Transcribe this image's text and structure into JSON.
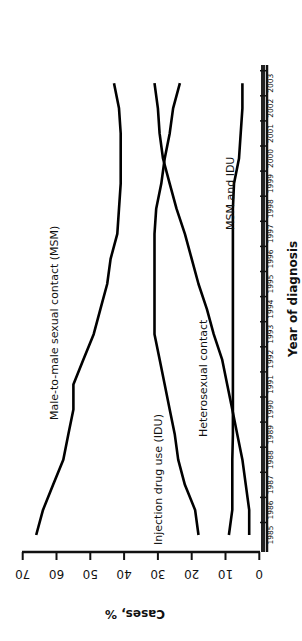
{
  "chart_data": {
    "type": "line",
    "title": "",
    "xlabel": "Year of diagnosis",
    "ylabel": "Cases, %",
    "ylim": [
      0,
      70
    ],
    "yticks": [
      0,
      10,
      20,
      30,
      40,
      50,
      60,
      70
    ],
    "grid": false,
    "legend_position": "inline labels",
    "orientation": "rotated 90° clockwise (x-axis on right, years ascending upward)",
    "x": [
      1985,
      1986,
      1987,
      1988,
      1989,
      1990,
      1991,
      1992,
      1993,
      1994,
      1995,
      1996,
      1997,
      1998,
      1999,
      2000,
      2001,
      2002,
      2003
    ],
    "series": [
      {
        "name": "Male-to-male sexual contact (MSM)",
        "values": [
          66,
          64,
          61,
          58,
          56.5,
          55,
          55,
          52,
          49,
          47,
          45,
          44,
          42,
          41.5,
          41,
          41,
          41,
          41.5,
          43
        ]
      },
      {
        "name": "Injection drug use (IDU)",
        "values": [
          18,
          19,
          22,
          24,
          25,
          26.5,
          28,
          29.5,
          31,
          31,
          31,
          31,
          31,
          30.5,
          29,
          28,
          26.5,
          25.5,
          23.5
        ]
      },
      {
        "name": "Heterosexual contact",
        "values": [
          3,
          3,
          4,
          5,
          6.5,
          8,
          9.5,
          11,
          13.5,
          15.5,
          18,
          20,
          22,
          24.5,
          26.5,
          28.5,
          29.5,
          30,
          31
        ]
      },
      {
        "name": "MSM and IDU",
        "values": [
          9,
          8,
          8,
          8,
          7.8,
          7.8,
          7.8,
          7.8,
          7.8,
          7.8,
          7.8,
          7.8,
          7.8,
          7.8,
          7.5,
          6,
          5.5,
          5,
          5
        ]
      }
    ]
  },
  "labels": {
    "msm": "Male-to-male sexual contact (MSM)",
    "idu": "Injection drug use (IDU)",
    "hetero": "Heterosexual contact",
    "msm_idu": "MSM and IDU",
    "xlabel": "Year of diagnosis",
    "ylabel": "Cases, %"
  }
}
